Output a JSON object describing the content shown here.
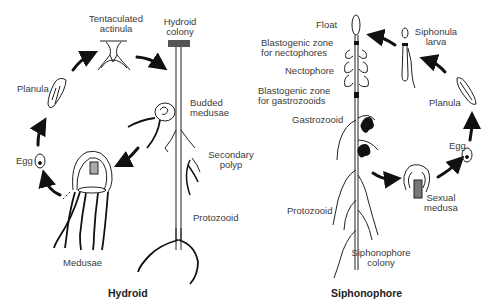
{
  "hydroid": {
    "title": "Hydroid",
    "labels": {
      "tentaculated_actinula_1": "Tentaculated",
      "tentaculated_actinula_2": "actinula",
      "hydroid_colony_1": "Hydroid",
      "hydroid_colony_2": "colony",
      "planula": "Planula",
      "budded_medusae_1": "Budded",
      "budded_medusae_2": "medusae",
      "egg": "Egg",
      "secondary_polyp_1": "Secondary",
      "secondary_polyp_2": "polyp",
      "protozooid": "Protozooid",
      "medusae": "Medusae"
    },
    "cycle": [
      "Hydroid colony",
      "Budded medusae",
      "Medusae",
      "Egg",
      "Planula",
      "Tentaculated actinula"
    ]
  },
  "siphonophore": {
    "title": "Siphonophore",
    "labels": {
      "float": "Float",
      "blasto_necto_1": "Blastogenic zone",
      "blasto_necto_2": "for nectophores",
      "nectophore": "Nectophore",
      "blasto_gastro_1": "Blastogenic zone",
      "blasto_gastro_2": "for gastrozooids",
      "gastrozooid": "Gastrozooid",
      "siphonula_larva_1": "Siphonula",
      "siphonula_larva_2": "larva",
      "planula": "Planula",
      "egg": "Egg",
      "sexual_medusa_1": "Sexual",
      "sexual_medusa_2": "medusa",
      "protozooid": "Protozooid",
      "colony_1": "Siphonophore",
      "colony_2": "colony"
    },
    "cycle": [
      "Siphonophore colony",
      "Sexual medusa",
      "Egg",
      "Planula",
      "Siphonula larva",
      "Float"
    ]
  }
}
